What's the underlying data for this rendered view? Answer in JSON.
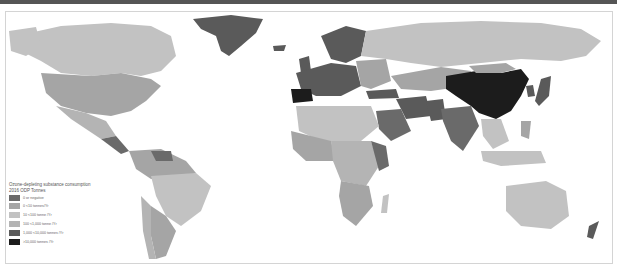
{
  "map": {
    "title_line1": "Ozone-depleting substance consumption",
    "title_line2": "2016 ODP Tonnes",
    "legend": [
      {
        "label": "0 or negative",
        "color": "#6a6a6a"
      },
      {
        "label": "0 <10 tonnes/Yr",
        "color": "#a5a5a5"
      },
      {
        "label": "10 <100 tonne /Yr",
        "color": "#c2c2c2"
      },
      {
        "label": "100 <1,000 tonne /Yr",
        "color": "#b4b4b4"
      },
      {
        "label": "1,000 <10,000 tonnes /Yr",
        "color": "#5a5a5a"
      },
      {
        "label": ">10,000 tonnes /Yr",
        "color": "#1c1c1c"
      }
    ],
    "background_color": "#ffffff",
    "header_bar_color": "#555555"
  }
}
